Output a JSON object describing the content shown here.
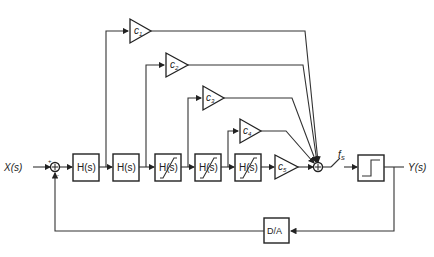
{
  "diagram": {
    "type": "sigma-delta modulator block diagram",
    "input_label": "X(s)",
    "output_label": "Y(s)",
    "integrators": [
      {
        "label": "H(s)",
        "limiter": false
      },
      {
        "label": "H(s)",
        "limiter": false
      },
      {
        "label": "H(s)",
        "limiter": true
      },
      {
        "label": "H(s)",
        "limiter": true
      },
      {
        "label": "H(s)",
        "limiter": true
      }
    ],
    "coefficients": [
      {
        "label": "c",
        "sub": "1"
      },
      {
        "label": "c",
        "sub": "2"
      },
      {
        "label": "c",
        "sub": "3"
      },
      {
        "label": "c",
        "sub": "4"
      },
      {
        "label": "c",
        "sub": "5"
      }
    ],
    "input_summer": {
      "plus": "+",
      "minus": "-"
    },
    "sampler_label": "f",
    "sampler_sub": "S",
    "quantizer": "1-bit quantizer",
    "feedback_block": "D/A"
  }
}
